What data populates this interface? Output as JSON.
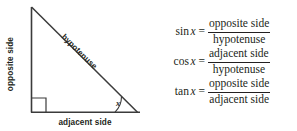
{
  "diagram": {
    "name": "right-triangle-trigonometry-diagram",
    "labels": {
      "opposite": "opposite side",
      "adjacent": "adjacent side",
      "hypotenuse": "hypotenuse",
      "angle": "x"
    },
    "geometry": {
      "apex": [
        31,
        7
      ],
      "right_angle_vertex": [
        31,
        112
      ],
      "angle_vertex": [
        137,
        112
      ],
      "right_angle_marker": "square",
      "angle_arc": "arc"
    },
    "colors": {
      "stroke": "#3b3b3b",
      "text": "#231f20",
      "background": "#ffffff"
    }
  },
  "formulas": [
    {
      "function": "sin",
      "variable": "x",
      "equals": "=",
      "numerator": "opposite side",
      "denominator": "hypotenuse"
    },
    {
      "function": "cos",
      "variable": "x",
      "equals": "=",
      "numerator": "adjacent side",
      "denominator": "hypotenuse"
    },
    {
      "function": "tan",
      "variable": "x",
      "equals": "=",
      "numerator": "opposite side",
      "denominator": "adjacent side"
    }
  ]
}
